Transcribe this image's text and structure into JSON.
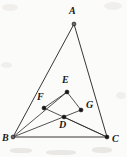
{
  "figure": {
    "background_color": "#fbfbfa",
    "ink_color": "#231f20",
    "width": 127,
    "height": 157,
    "points": [
      {
        "id": "A",
        "label": "A",
        "x": 74,
        "y": 24,
        "label_x": 69,
        "label_y": 6,
        "marker": "open"
      },
      {
        "id": "B",
        "label": "B",
        "x": 13,
        "y": 137,
        "label_x": 2,
        "label_y": 133,
        "marker": "open"
      },
      {
        "id": "C",
        "label": "C",
        "x": 107,
        "y": 137,
        "label_x": 112,
        "label_y": 134,
        "marker": "filled"
      },
      {
        "id": "D",
        "label": "D",
        "x": 64,
        "y": 117,
        "label_x": 59,
        "label_y": 120,
        "marker": "filled"
      },
      {
        "id": "E",
        "label": "E",
        "x": 67,
        "y": 92,
        "label_x": 62,
        "label_y": 75,
        "marker": "filled"
      },
      {
        "id": "F",
        "label": "F",
        "x": 44,
        "y": 108,
        "label_x": 37,
        "label_y": 92,
        "marker": "filled"
      },
      {
        "id": "G",
        "label": "G",
        "x": 81,
        "y": 110,
        "label_x": 86,
        "label_y": 100,
        "marker": "filled"
      }
    ],
    "segments": [
      {
        "id": "AB",
        "from": "A",
        "to": "B",
        "weight": "normal"
      },
      {
        "id": "AC",
        "from": "A",
        "to": "C",
        "weight": "normal"
      },
      {
        "id": "BC",
        "from": "B",
        "to": "C",
        "weight": "normal"
      },
      {
        "id": "EF",
        "from": "E",
        "to": "F",
        "weight": "thin"
      },
      {
        "id": "EG",
        "from": "E",
        "to": "G",
        "weight": "thin"
      },
      {
        "id": "BG",
        "from": "B",
        "to": "G",
        "weight": "thin"
      },
      {
        "id": "CF",
        "from": "C",
        "to": "F",
        "weight": "thin"
      },
      {
        "id": "BE",
        "from": "B",
        "to": "E",
        "weight": "thin"
      },
      {
        "id": "CD",
        "from": "C",
        "to": "D",
        "weight": "thin"
      }
    ],
    "artifacts": [
      {
        "id": "smudge-top-left",
        "x": 2,
        "y": 4,
        "w": 16,
        "h": 7,
        "kind": "soft"
      },
      {
        "id": "smudge-top-right",
        "x": 104,
        "y": 2,
        "w": 18,
        "h": 8,
        "kind": "soft"
      },
      {
        "id": "smudge-mid-left",
        "x": 1,
        "y": 62,
        "w": 11,
        "h": 6,
        "kind": "soft"
      },
      {
        "id": "smudge-bottom-a",
        "x": 10,
        "y": 148,
        "w": 22,
        "h": 5,
        "kind": "hard"
      },
      {
        "id": "smudge-bottom-b",
        "x": 46,
        "y": 150,
        "w": 30,
        "h": 5,
        "kind": "hard"
      },
      {
        "id": "smudge-bottom-c",
        "x": 92,
        "y": 147,
        "w": 20,
        "h": 6,
        "kind": "hard"
      },
      {
        "id": "smudge-right-mid",
        "x": 116,
        "y": 92,
        "w": 10,
        "h": 7,
        "kind": "soft"
      }
    ]
  }
}
